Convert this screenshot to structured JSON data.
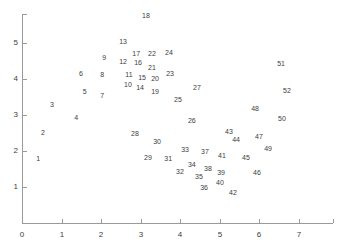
{
  "chart_data": {
    "type": "scatter",
    "title": "",
    "subtitle": "",
    "xlabel": "",
    "ylabel": "",
    "xlim": [
      0,
      7.6
    ],
    "ylim": [
      0,
      5.7
    ],
    "grid": false,
    "legend": null,
    "marker_style": "numeric-label",
    "x_ticks": [
      "0",
      "1",
      "2",
      "3",
      "4",
      "5",
      "6",
      "7"
    ],
    "x_tick_values": [
      0,
      1,
      2,
      3,
      4,
      5,
      6,
      7
    ],
    "y_ticks": [
      "1",
      "2",
      "3",
      "4",
      "5"
    ],
    "y_tick_values": [
      1,
      2,
      3,
      4,
      5
    ],
    "axis_color": "#9a9a9a",
    "label_color": "#3d3d3d",
    "points": [
      {
        "label": "1",
        "x": 0.41,
        "y": 1.81
      },
      {
        "label": "2",
        "x": 0.53,
        "y": 2.53
      },
      {
        "label": "3",
        "x": 0.76,
        "y": 3.31
      },
      {
        "label": "4",
        "x": 1.37,
        "y": 2.94
      },
      {
        "label": "5",
        "x": 1.59,
        "y": 3.67
      },
      {
        "label": "6",
        "x": 1.49,
        "y": 4.17
      },
      {
        "label": "7",
        "x": 2.03,
        "y": 3.56
      },
      {
        "label": "8",
        "x": 2.03,
        "y": 4.14
      },
      {
        "label": "9",
        "x": 2.08,
        "y": 4.61
      },
      {
        "label": "10",
        "x": 2.68,
        "y": 3.86
      },
      {
        "label": "11",
        "x": 2.71,
        "y": 4.14
      },
      {
        "label": "12",
        "x": 2.56,
        "y": 4.5
      },
      {
        "label": "13",
        "x": 2.56,
        "y": 5.06
      },
      {
        "label": "14",
        "x": 2.99,
        "y": 3.78
      },
      {
        "label": "15",
        "x": 3.04,
        "y": 4.06
      },
      {
        "label": "16",
        "x": 2.94,
        "y": 4.47
      },
      {
        "label": "17",
        "x": 2.89,
        "y": 4.72
      },
      {
        "label": "18",
        "x": 3.14,
        "y": 5.78
      },
      {
        "label": "19",
        "x": 3.37,
        "y": 3.67
      },
      {
        "label": "20",
        "x": 3.37,
        "y": 4.03
      },
      {
        "label": "21",
        "x": 3.29,
        "y": 4.33
      },
      {
        "label": "22",
        "x": 3.29,
        "y": 4.72
      },
      {
        "label": "23",
        "x": 3.75,
        "y": 4.17
      },
      {
        "label": "24",
        "x": 3.72,
        "y": 4.75
      },
      {
        "label": "25",
        "x": 3.95,
        "y": 3.44
      },
      {
        "label": "26",
        "x": 4.3,
        "y": 2.86
      },
      {
        "label": "27",
        "x": 4.43,
        "y": 3.78
      },
      {
        "label": "28",
        "x": 2.86,
        "y": 2.5
      },
      {
        "label": "29",
        "x": 3.19,
        "y": 1.83
      },
      {
        "label": "30",
        "x": 3.42,
        "y": 2.28
      },
      {
        "label": "31",
        "x": 3.7,
        "y": 1.81
      },
      {
        "label": "32",
        "x": 4.0,
        "y": 1.44
      },
      {
        "label": "33",
        "x": 4.13,
        "y": 2.06
      },
      {
        "label": "34",
        "x": 4.3,
        "y": 1.64
      },
      {
        "label": "35",
        "x": 4.48,
        "y": 1.31
      },
      {
        "label": "36",
        "x": 4.61,
        "y": 1.0
      },
      {
        "label": "37",
        "x": 4.63,
        "y": 2.0
      },
      {
        "label": "38",
        "x": 4.71,
        "y": 1.53
      },
      {
        "label": "39",
        "x": 5.04,
        "y": 1.42
      },
      {
        "label": "40",
        "x": 5.01,
        "y": 1.14
      },
      {
        "label": "41",
        "x": 5.06,
        "y": 1.89
      },
      {
        "label": "42",
        "x": 5.34,
        "y": 0.86
      },
      {
        "label": "43",
        "x": 5.24,
        "y": 2.56
      },
      {
        "label": "44",
        "x": 5.42,
        "y": 2.33
      },
      {
        "label": "45",
        "x": 5.67,
        "y": 1.83
      },
      {
        "label": "46",
        "x": 5.95,
        "y": 1.42
      },
      {
        "label": "47",
        "x": 6.0,
        "y": 2.42
      },
      {
        "label": "48",
        "x": 5.9,
        "y": 3.19
      },
      {
        "label": "49",
        "x": 6.23,
        "y": 2.08
      },
      {
        "label": "50",
        "x": 6.58,
        "y": 2.92
      },
      {
        "label": "51",
        "x": 6.56,
        "y": 4.44
      },
      {
        "label": "52",
        "x": 6.71,
        "y": 3.69
      }
    ]
  }
}
